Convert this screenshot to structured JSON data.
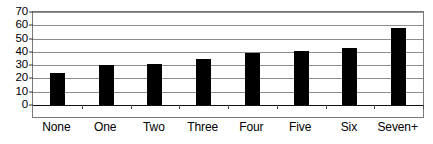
{
  "chart_data": {
    "type": "bar",
    "title": "",
    "subtitle": "",
    "xlabel": "",
    "ylabel": "",
    "categories": [
      "None",
      "One",
      "Two",
      "Three",
      "Four",
      "Five",
      "Six",
      "Seven+"
    ],
    "values": [
      24,
      30,
      30.5,
      35,
      39,
      41,
      43,
      58
    ],
    "ylim": [
      0,
      70
    ],
    "yticks": [
      0,
      10,
      20,
      30,
      40,
      50,
      60,
      70
    ],
    "ytick_labels": [
      "0",
      "10",
      "20",
      "30",
      "40",
      "50",
      "60",
      "70"
    ],
    "grid": true,
    "grid_axis": "y",
    "legend": false,
    "legend_position": "none",
    "bar_color": "#000000",
    "grid_color": "#8c8c8c",
    "frame_color": "#7a7a7a",
    "background_color": "#ffffff",
    "text_color": "#000000"
  }
}
